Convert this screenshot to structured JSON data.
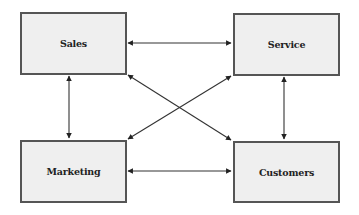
{
  "diagram": {
    "type": "relationship-diagram",
    "colors": {
      "box_fill": "#efefef",
      "box_border": "#555555",
      "arrow": "#333333",
      "text": "#222222",
      "background": "#ffffff"
    },
    "nodes": [
      {
        "id": "sales",
        "label": "Sales"
      },
      {
        "id": "service",
        "label": "Service"
      },
      {
        "id": "marketing",
        "label": "Marketing"
      },
      {
        "id": "customers",
        "label": "Customers"
      }
    ],
    "edges": [
      {
        "from": "sales",
        "to": "service",
        "direction": "bidirectional"
      },
      {
        "from": "marketing",
        "to": "customers",
        "direction": "bidirectional"
      },
      {
        "from": "sales",
        "to": "marketing",
        "direction": "bidirectional"
      },
      {
        "from": "service",
        "to": "customers",
        "direction": "bidirectional"
      },
      {
        "from": "sales",
        "to": "customers",
        "direction": "bidirectional"
      },
      {
        "from": "service",
        "to": "marketing",
        "direction": "bidirectional"
      }
    ]
  }
}
